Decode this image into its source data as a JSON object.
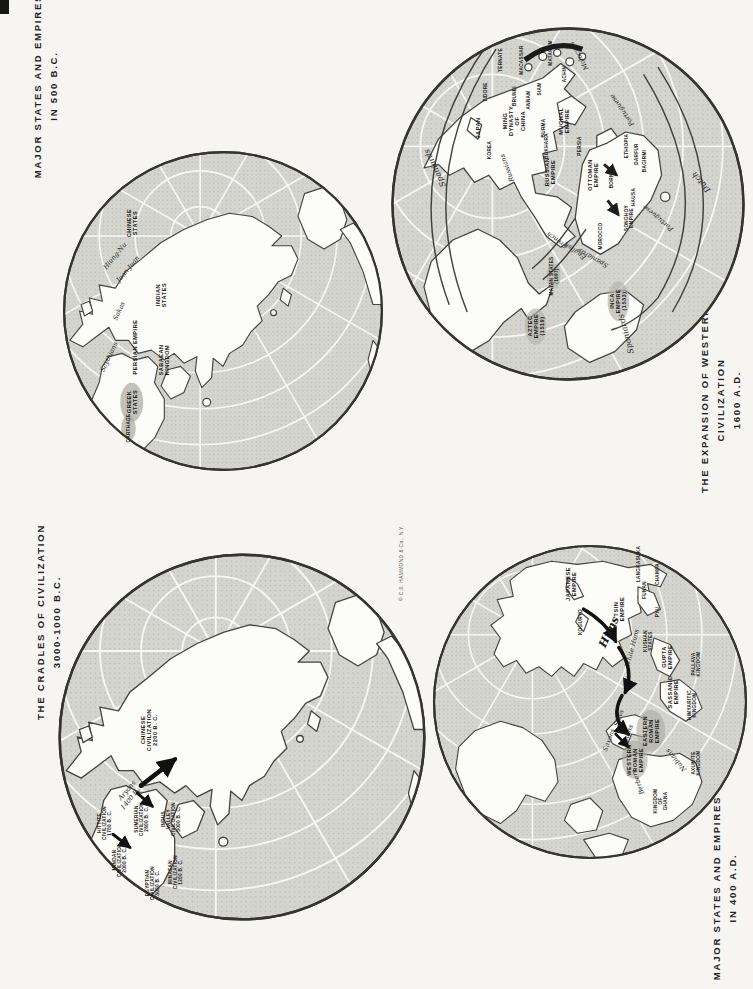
{
  "copyright": "© C.S. HAMMOND & Co., N.Y.",
  "colors": {
    "paper": "#f6f5f1",
    "ocean": "#d6d6d1",
    "ocean_dot": "#bbbbb5",
    "land": "#fcfcf8",
    "outline": "#3a3a34",
    "ink": "#23221f"
  },
  "maps": [
    {
      "id": "major-states-500bc",
      "title_lines": [
        "MAJOR STATES AND EMPIRES",
        "IN 500 B.C."
      ],
      "labels": [
        {
          "text": "CHINESE\nSTATES",
          "x": 22,
          "y": 23,
          "style": "caps"
        },
        {
          "text": "Hiung-Nu",
          "x": 17,
          "y": 33,
          "style": "ital",
          "tilt": 40
        },
        {
          "text": "Juan-Juan",
          "x": 21,
          "y": 37,
          "style": "ital",
          "tilt": 40
        },
        {
          "text": "INDIAN\nSTATES",
          "x": 31,
          "y": 45,
          "style": "caps"
        },
        {
          "text": "Sakas",
          "x": 18,
          "y": 50,
          "style": "ital",
          "tilt": 25
        },
        {
          "text": "Scythians",
          "x": 15,
          "y": 64,
          "style": "ital",
          "tilt": 25
        },
        {
          "text": "PERSIAN EMPIRE",
          "x": 23,
          "y": 61,
          "style": "caps"
        },
        {
          "text": "SABAEAN\nKINGDOM",
          "x": 32,
          "y": 65,
          "style": "caps"
        },
        {
          "text": "GREEK\nSTATES",
          "x": 22,
          "y": 78,
          "style": "caps"
        },
        {
          "text": "CARTHAGE",
          "x": 21,
          "y": 86,
          "style": "caps-t"
        }
      ]
    },
    {
      "id": "expansion-western-civilization-1600ad",
      "title_lines": [
        "THE EXPANSION OF WESTERN",
        "CIVILIZATION",
        "1600 A.D."
      ],
      "labels": [
        {
          "text": "MATARAM",
          "x": 45,
          "y": 8,
          "style": "caps-t"
        },
        {
          "text": "MACASSAR",
          "x": 37,
          "y": 10,
          "style": "caps-t"
        },
        {
          "text": "TERNATE",
          "x": 31,
          "y": 10,
          "style": "caps-t"
        },
        {
          "text": "TIDORE",
          "x": 27,
          "y": 19,
          "style": "caps-t"
        },
        {
          "text": "Moluccas",
          "x": 53,
          "y": 9,
          "style": "ital",
          "tilt": -30
        },
        {
          "text": "BRUNEI",
          "x": 35,
          "y": 20,
          "style": "caps-t"
        },
        {
          "text": "ANNAM",
          "x": 39,
          "y": 21,
          "style": "caps-t"
        },
        {
          "text": "SIAM",
          "x": 42,
          "y": 18,
          "style": "caps-t"
        },
        {
          "text": "ACHIN",
          "x": 49,
          "y": 14,
          "style": "caps-t"
        },
        {
          "text": "JAPAN",
          "x": 25,
          "y": 29,
          "style": "caps"
        },
        {
          "text": "KOREA",
          "x": 28,
          "y": 35,
          "style": "caps-t"
        },
        {
          "text": "Spaniards",
          "x": 13,
          "y": 40,
          "style": "ital-lg",
          "tilt": -25
        },
        {
          "text": "MING\nDYNASTY\nOF\nCHINA",
          "x": 35,
          "y": 27,
          "style": "caps"
        },
        {
          "text": "BURMA",
          "x": 43,
          "y": 29,
          "style": "caps-t"
        },
        {
          "text": "MUGHAL\nEMPIRE",
          "x": 49,
          "y": 27,
          "style": "caps"
        },
        {
          "text": "BUKHARA",
          "x": 44,
          "y": 34,
          "style": "caps-t"
        },
        {
          "text": "PERSIA",
          "x": 53,
          "y": 34,
          "style": "caps-t"
        },
        {
          "text": "Russians",
          "x": 33,
          "y": 40,
          "style": "ital",
          "tilt": -20
        },
        {
          "text": "RUSSIAN\nEMPIRE",
          "x": 45,
          "y": 41,
          "style": "caps"
        },
        {
          "text": "OTTOMAN\nEMPIRE",
          "x": 57,
          "y": 42,
          "style": "caps"
        },
        {
          "text": "Portuguese",
          "x": 65,
          "y": 24,
          "style": "ital",
          "tilt": -35
        },
        {
          "text": "ETHIOPIA",
          "x": 66,
          "y": 34,
          "style": "caps-t"
        },
        {
          "text": "DARFUR",
          "x": 69,
          "y": 36,
          "style": "caps-t"
        },
        {
          "text": "BAGIRMI",
          "x": 71,
          "y": 38,
          "style": "caps-t"
        },
        {
          "text": "BORNU",
          "x": 62,
          "y": 43,
          "style": "caps-t"
        },
        {
          "text": "Dutch",
          "x": 87,
          "y": 44,
          "style": "ital-lg",
          "tilt": -40
        },
        {
          "text": "HAUSA",
          "x": 68,
          "y": 48,
          "style": "caps-t"
        },
        {
          "text": "SONGHOY\nEMPIRE",
          "x": 67,
          "y": 54,
          "style": "caps-t"
        },
        {
          "text": "Portuguese",
          "x": 75,
          "y": 54,
          "style": "ital",
          "tilt": -50
        },
        {
          "text": "MOROCCO",
          "x": 59,
          "y": 59,
          "style": "caps-t"
        },
        {
          "text": "Spaniards",
          "x": 57,
          "y": 65,
          "style": "ital",
          "tilt": -60
        },
        {
          "text": "English",
          "x": 52,
          "y": 63,
          "style": "ital",
          "tilt": -55
        },
        {
          "text": "French",
          "x": 47,
          "y": 60,
          "style": "ital",
          "tilt": -55
        },
        {
          "text": "MAYAN STATES\n(1697)",
          "x": 46,
          "y": 70,
          "style": "caps-t"
        },
        {
          "text": "AZTEC\nEMPIRE\n(1519)",
          "x": 41,
          "y": 84,
          "style": "caps"
        },
        {
          "text": "INCA\nEMPIRE\n(1533)",
          "x": 64,
          "y": 77,
          "style": "caps"
        },
        {
          "text": "Spaniards",
          "x": 66,
          "y": 86,
          "style": "ital-lg",
          "tilt": -15
        }
      ]
    },
    {
      "id": "cradles-of-civilization",
      "title_lines": [
        "THE CRADLES OF CIVILIZATION",
        "3000-1000 B.C."
      ],
      "labels": [
        {
          "text": "CHINESE\nCIVILIZATION\n2200 B. C.",
          "x": 25,
          "y": 48,
          "style": "caps"
        },
        {
          "text": "Aryans\n1400 B. C.",
          "x": 20,
          "y": 65,
          "style": "ital",
          "tilt": 40
        },
        {
          "text": "HITTITE\nCIVILIZATION\n1700 B. C.",
          "x": 13,
          "y": 73,
          "style": "caps-t"
        },
        {
          "text": "SUMERIAN\nCIVILIZATION\n2800 B. C.",
          "x": 23,
          "y": 72,
          "style": "caps-t"
        },
        {
          "text": "INDUS\nVALLEY\nCIVILIZATION\n3000 B. C.",
          "x": 31,
          "y": 72,
          "style": "caps-t"
        },
        {
          "text": "MINOAN\nCIVILIZATION\n2000 B. C.",
          "x": 17,
          "y": 83,
          "style": "caps-t"
        },
        {
          "text": "EGYPTIAN\nCIVILIZATION\n3000 B. C.",
          "x": 26,
          "y": 89,
          "style": "caps-t"
        },
        {
          "text": "MINAEAN\nCIVILIZATION\n1200 B. C.",
          "x": 32,
          "y": 86,
          "style": "caps-t"
        }
      ]
    },
    {
      "id": "major-states-400ad",
      "title_lines": [
        "MAJOR STATES AND EMPIRES",
        "IN 400 A.D."
      ],
      "labels": [
        {
          "text": "JAPANESE\nEMPIRE",
          "x": 44,
          "y": 13,
          "style": "caps"
        },
        {
          "text": "KOGURYO",
          "x": 47,
          "y": 25,
          "style": "caps-t"
        },
        {
          "text": "TSIN\nEMPIRE",
          "x": 59,
          "y": 21,
          "style": "caps"
        },
        {
          "text": "PYU",
          "x": 71,
          "y": 22,
          "style": "caps-t"
        },
        {
          "text": "FUNAN",
          "x": 67,
          "y": 15,
          "style": "caps-t"
        },
        {
          "text": "CHAMPA",
          "x": 71,
          "y": 10,
          "style": "caps-t"
        },
        {
          "text": "LANGKASUKA",
          "x": 65,
          "y": 7,
          "style": "caps-t"
        },
        {
          "text": "Huns",
          "x": 56,
          "y": 28,
          "style": "ital-xl",
          "tilt": 25
        },
        {
          "text": "White Huns",
          "x": 63,
          "y": 33,
          "style": "ital",
          "tilt": 15
        },
        {
          "text": "KUSHAN\nSTATES",
          "x": 68,
          "y": 31,
          "style": "caps-t"
        },
        {
          "text": "GUPTA\nEMPIRE",
          "x": 74,
          "y": 36,
          "style": "caps"
        },
        {
          "text": "PALLAVA\nKINGDOM",
          "x": 83,
          "y": 38,
          "style": "caps-t"
        },
        {
          "text": "SASSANID\nEMPIRE",
          "x": 76,
          "y": 47,
          "style": "caps"
        },
        {
          "text": "HIMYARITIC\nKINGDOM",
          "x": 82,
          "y": 51,
          "style": "caps-t"
        },
        {
          "text": "EASTERN\nROMAN\nEMPIRE",
          "x": 69,
          "y": 59,
          "style": "caps"
        },
        {
          "text": "WESTERN\nROMAN\nEMPIRE",
          "x": 64,
          "y": 68,
          "style": "caps"
        },
        {
          "text": "Slavs",
          "x": 59,
          "y": 55,
          "style": "ital",
          "tilt": 20
        },
        {
          "text": "Goths",
          "x": 62,
          "y": 60,
          "style": "ital",
          "tilt": 20
        },
        {
          "text": "Saxons",
          "x": 56,
          "y": 62,
          "style": "ital",
          "tilt": 20
        },
        {
          "text": "Berbers",
          "x": 65,
          "y": 75,
          "style": "ital",
          "tilt": -20
        },
        {
          "text": "Nubians",
          "x": 77,
          "y": 68,
          "style": "ital",
          "tilt": -40
        },
        {
          "text": "AXUMITE\nKINGDOM",
          "x": 83,
          "y": 69,
          "style": "caps-t"
        },
        {
          "text": "KINGDOM\nOF\nGHANA",
          "x": 72,
          "y": 81,
          "style": "caps-t"
        }
      ]
    }
  ]
}
